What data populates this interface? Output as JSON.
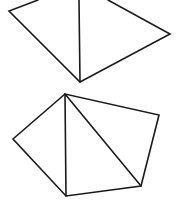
{
  "diagram": {
    "stroke_color": "#1a1a1a",
    "background": "#ffffff",
    "shapes": [
      {
        "name": "top-quadrilateral",
        "outline": [
          [
            38,
            0
          ],
          [
            9,
            11
          ],
          [
            80,
            82
          ],
          [
            170,
            34
          ],
          [
            108,
            0
          ]
        ],
        "diagonals": [
          [
            [
              79,
              0
            ],
            [
              80,
              82
            ]
          ]
        ]
      },
      {
        "name": "bottom-pentagon",
        "outline": [
          [
            65,
            94
          ],
          [
            13,
            139
          ],
          [
            66,
            196
          ],
          [
            141,
            186
          ],
          [
            159,
            115
          ]
        ],
        "diagonals": [
          [
            [
              65,
              94
            ],
            [
              66,
              196
            ]
          ],
          [
            [
              65,
              94
            ],
            [
              141,
              186
            ]
          ]
        ]
      }
    ]
  }
}
